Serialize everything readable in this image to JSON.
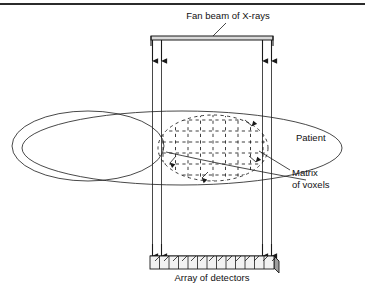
{
  "figure": {
    "background_color": "#ffffff",
    "line_color": "#1a1a1a",
    "width": 365,
    "height": 294
  },
  "labels": {
    "fan_beam": "Fan beam of X-rays",
    "patient": "Patient",
    "matrix_line1": "Matrix",
    "matrix_line2": "of voxels",
    "detectors": "Array of detectors"
  },
  "diagram": {
    "top_rule": {
      "y": 3,
      "height": 2,
      "color": "#2b2b2b"
    },
    "source_bar": {
      "x": 151,
      "y": 36,
      "width": 122,
      "height": 4,
      "fill": "#d9d9d9"
    },
    "beam_lines_x": [
      152.5,
      161.5,
      262.5,
      271.5
    ],
    "beam_top_y": 40,
    "beam_bottom_y": 256,
    "arrow_head_y": 65,
    "patient_body_ellipse": {
      "cx": 182,
      "cy": 148,
      "rx": 160,
      "ry": 37
    },
    "patient_head_ellipse": {
      "cx": 88,
      "cy": 146,
      "rx": 76,
      "ry": 35
    },
    "voxel_ellipse": {
      "cx": 213,
      "cy": 148,
      "rx": 55,
      "ry": 33
    },
    "voxel_grid": {
      "columns": 9,
      "rows": 6,
      "cell_width": 12.5,
      "cell_height": 11,
      "dash": "3.2 3.4"
    },
    "detector_array": {
      "x": 150,
      "y": 256,
      "width": 124,
      "height": 14,
      "cells": 13,
      "face_fill": "#f2f2f2",
      "top_fill": "#bdbdbd",
      "side_fill": "#9e9e9e"
    },
    "leader_lines": {
      "fan_beam": {
        "x1": 228,
        "y1": 22,
        "x2": 212,
        "y2": 37
      },
      "matrix": {
        "x1": 290,
        "y1": 172,
        "x2": 258,
        "y2": 152
      },
      "patient": {
        "x1": 176,
        "y1": 160,
        "x2": 300,
        "y2": 179
      }
    }
  }
}
